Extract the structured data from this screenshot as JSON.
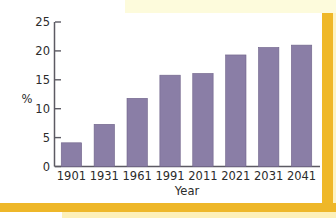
{
  "figure": {
    "background_color": "#ffffff",
    "accent_gold": "#efb828",
    "accent_pale_yellow": "#fdfbdc",
    "bar_color": "#8a7ea6",
    "axis_color": "#5c5a63",
    "text_color": "#2b2b2b"
  },
  "decorations": {
    "top_band_label": "page-top-accent-band",
    "right_rule_label": "page-right-accent-rule",
    "bottom_rule_label": "page-bottom-accent-rule"
  },
  "chart_data": {
    "type": "bar",
    "title": "",
    "subtitle": "",
    "xlabel": "Year",
    "ylabel": "%",
    "categories": [
      "1901",
      "1931",
      "1961",
      "1991",
      "2011",
      "2021",
      "2031",
      "2041"
    ],
    "values": [
      4.1,
      7.3,
      11.8,
      15.8,
      16.1,
      19.3,
      20.6,
      21.0
    ],
    "series": [
      {
        "name": "",
        "values": [
          4.1,
          7.3,
          11.8,
          15.8,
          16.1,
          19.3,
          20.6,
          21.0
        ],
        "color": "#8a7ea6"
      }
    ],
    "ylim": [
      0,
      25
    ],
    "yticks": [
      0,
      5,
      10,
      15,
      20,
      25
    ],
    "ytick_labels": [
      "0",
      "5",
      "10",
      "15",
      "20",
      "25"
    ],
    "xtick_labels": [
      "1901",
      "1931",
      "1961",
      "1991",
      "2011",
      "2021",
      "2031",
      "2041"
    ],
    "grid": false,
    "legend": false,
    "legend_position": "none",
    "annotations": []
  }
}
